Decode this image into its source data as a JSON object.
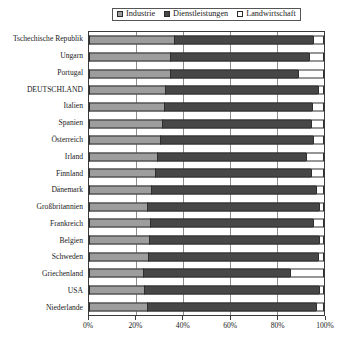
{
  "chart_data": {
    "type": "bar",
    "subtype": "stacked-horizontal-100-percent",
    "title": "",
    "xlabel": "",
    "ylabel": "",
    "xlim": [
      0,
      100
    ],
    "xticks": [
      "0%",
      "20%",
      "40%",
      "60%",
      "80%",
      "100%"
    ],
    "xtick_values": [
      0,
      20,
      40,
      60,
      80,
      100
    ],
    "grid": true,
    "legend_position": "top-center",
    "categories": [
      "Tschechische Republik",
      "Ungarn",
      "Portugal",
      "DEUTSCHLAND",
      "Italien",
      "Spanien",
      "Österreich",
      "Irland",
      "Finnland",
      "Dänemark",
      "Großbritannien",
      "Frankreich",
      "Belgien",
      "Schweden",
      "Griechenland",
      "USA",
      "Niederlande"
    ],
    "series": [
      {
        "name": "Industrie",
        "color": "#9d9d9d",
        "values": [
          36.0,
          34.5,
          34.5,
          32.5,
          32.0,
          31.0,
          30.0,
          29.0,
          28.0,
          26.5,
          24.5,
          26.0,
          25.5,
          25.0,
          23.0,
          23.5,
          24.5
        ]
      },
      {
        "name": "Dienstleistungen",
        "color": "#474747",
        "values": [
          59.5,
          59.0,
          54.5,
          64.8,
          63.0,
          63.5,
          65.5,
          63.5,
          66.5,
          70.0,
          73.5,
          69.5,
          72.5,
          72.5,
          62.5,
          74.5,
          72.0
        ]
      },
      {
        "name": "Landwirtschaft",
        "color": "#ffffff",
        "values": [
          4.5,
          6.5,
          11.0,
          2.7,
          5.0,
          5.5,
          4.5,
          7.5,
          5.5,
          3.5,
          2.0,
          4.5,
          2.0,
          2.5,
          14.5,
          2.0,
          3.5
        ]
      }
    ]
  },
  "legend": {
    "entries": [
      {
        "label": "Industrie",
        "swatch": "industrie-swatch-icon"
      },
      {
        "label": "Dienstleistungen",
        "swatch": "dienstleistungen-swatch-icon"
      },
      {
        "label": "Landwirtschaft",
        "swatch": "landwirtschaft-swatch-icon"
      }
    ]
  }
}
